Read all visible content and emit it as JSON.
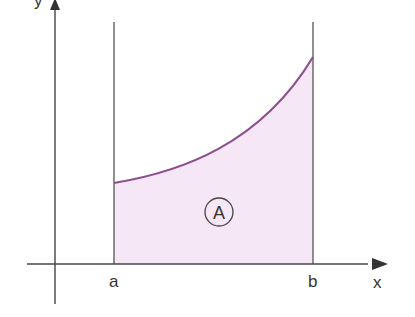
{
  "diagram": {
    "type": "area-under-curve",
    "axes": {
      "x_label": "x",
      "y_label": "y"
    },
    "bounds": {
      "left_label": "a",
      "right_label": "b"
    },
    "region": {
      "label": "A",
      "fill_color": "#f6e7f6"
    },
    "curve": {
      "color": "#8e4f8e",
      "shape": "increasing convex (exponential-like)"
    },
    "axis_color": "#444444"
  }
}
